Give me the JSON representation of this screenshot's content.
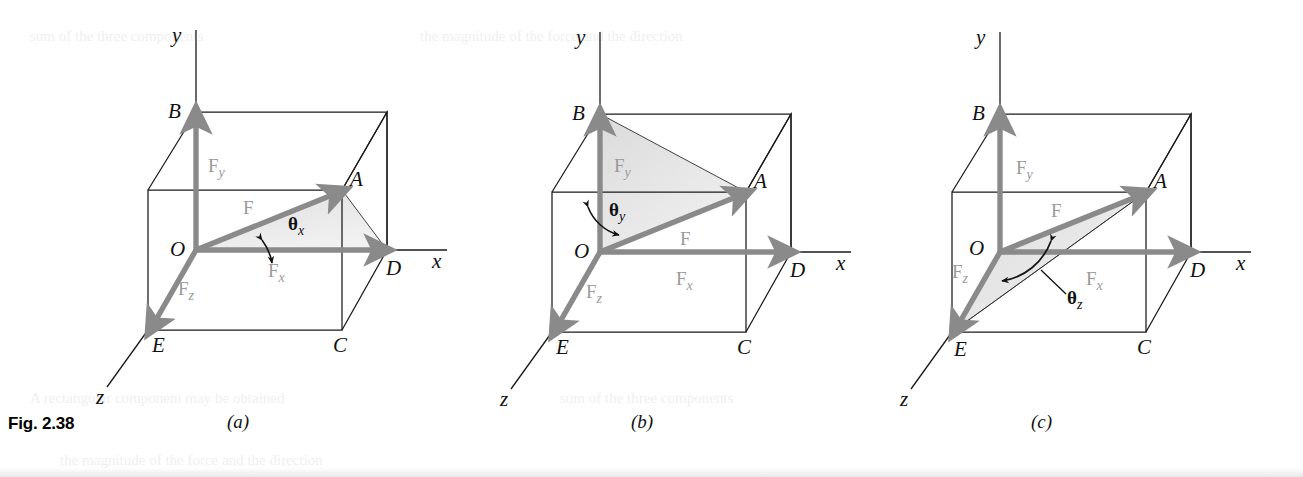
{
  "figure": {
    "label": "Fig. 2.38",
    "panels": [
      {
        "key": "a",
        "caption": "(a)",
        "axis_y": "y",
        "axis_x": "x",
        "axis_z": "z",
        "vertices": {
          "O": "O",
          "A": "A",
          "B": "B",
          "C": "C",
          "D": "D",
          "E": "E"
        },
        "vectors": {
          "F": "F",
          "Fx": "F",
          "Fx_sub": "x",
          "Fy": "F",
          "Fy_sub": "y",
          "Fz": "F",
          "Fz_sub": "z"
        },
        "angle": {
          "symbol": "θ",
          "subscript": "x"
        }
      },
      {
        "key": "b",
        "caption": "(b)",
        "axis_y": "y",
        "axis_x": "x",
        "axis_z": "z",
        "vertices": {
          "O": "O",
          "A": "A",
          "B": "B",
          "C": "C",
          "D": "D",
          "E": "E"
        },
        "vectors": {
          "F": "F",
          "Fx": "F",
          "Fx_sub": "x",
          "Fy": "F",
          "Fy_sub": "y",
          "Fz": "F",
          "Fz_sub": "z"
        },
        "angle": {
          "symbol": "θ",
          "subscript": "y"
        }
      },
      {
        "key": "c",
        "caption": "(c)",
        "axis_y": "y",
        "axis_x": "x",
        "axis_z": "z",
        "vertices": {
          "O": "O",
          "A": "A",
          "B": "B",
          "C": "C",
          "D": "D",
          "E": "E"
        },
        "vectors": {
          "F": "F",
          "Fx": "F",
          "Fx_sub": "x",
          "Fy": "F",
          "Fy_sub": "y",
          "Fz": "F",
          "Fz_sub": "z"
        },
        "angle": {
          "symbol": "θ",
          "subscript": "z"
        }
      }
    ]
  },
  "colors": {
    "vector_gray": "#8a8a8a",
    "label_gray": "#9a9a9a",
    "line_black": "#1a1a1a",
    "shade_fill": "#e4e4e4",
    "background": "#ffffff"
  },
  "ghost_text": {
    "line1": "sum of the three components",
    "line2": "the magnitude of the force and the direction",
    "line3": "A rectangular component may be obtained"
  }
}
